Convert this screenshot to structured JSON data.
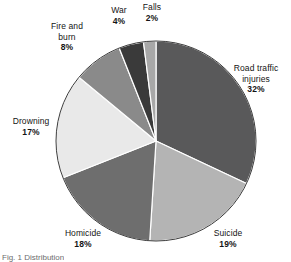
{
  "figure": {
    "caption": "Fig. 1 Distribution"
  },
  "chart_data": {
    "type": "pie",
    "title": "",
    "start_angle_deg": 0,
    "direction": "clockwise",
    "legend": "none",
    "labels_position": "outside",
    "center": {
      "x": 156,
      "y": 141
    },
    "radius": 100,
    "categories": [
      "Road traffic injuries",
      "Suicide",
      "Homicide",
      "Drowning",
      "Fire and burn",
      "War",
      "Falls"
    ],
    "values": [
      32,
      19,
      18,
      17,
      8,
      4,
      2
    ],
    "value_suffix": "%",
    "colors": [
      "#59595a",
      "#b4b4b4",
      "#6e6e6e",
      "#e9e9e9",
      "#8a8a8a",
      "#3a3a3a",
      "#a8a8a8"
    ],
    "slices": [
      {
        "name": "Road traffic injuries",
        "label_line1": "Road traffic",
        "label_line2": "injuries",
        "value": 32,
        "value_text": "32%",
        "color": "#59595a"
      },
      {
        "name": "Suicide",
        "label_line1": "Suicide",
        "label_line2": "",
        "value": 19,
        "value_text": "19%",
        "color": "#b4b4b4"
      },
      {
        "name": "Homicide",
        "label_line1": "Homicide",
        "label_line2": "",
        "value": 18,
        "value_text": "18%",
        "color": "#6e6e6e"
      },
      {
        "name": "Drowning",
        "label_line1": "Drowning",
        "label_line2": "",
        "value": 17,
        "value_text": "17%",
        "color": "#e9e9e9"
      },
      {
        "name": "Fire and burn",
        "label_line1": "Fire and",
        "label_line2": "burn",
        "value": 8,
        "value_text": "8%",
        "color": "#8a8a8a"
      },
      {
        "name": "War",
        "label_line1": "War",
        "label_line2": "",
        "value": 4,
        "value_text": "4%",
        "color": "#3a3a3a"
      },
      {
        "name": "Falls",
        "label_line1": "Falls",
        "label_line2": "",
        "value": 2,
        "value_text": "2%",
        "color": "#a8a8a8"
      }
    ]
  }
}
